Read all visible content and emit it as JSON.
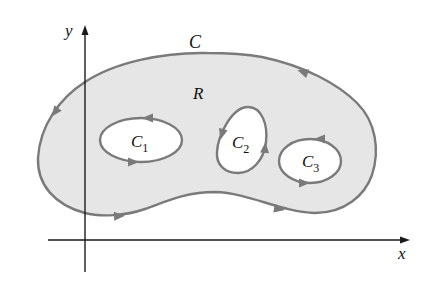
{
  "figure": {
    "type": "region-with-holes-diagram",
    "axes": {
      "x_label": "x",
      "y_label": "y"
    },
    "outer_curve": {
      "label": "C",
      "orientation": "counterclockwise"
    },
    "region": {
      "label": "R"
    },
    "inner_curves": [
      {
        "label": "C",
        "subscript": "1",
        "orientation": "clockwise"
      },
      {
        "label": "C",
        "subscript": "2",
        "orientation": "clockwise"
      },
      {
        "label": "C",
        "subscript": "3",
        "orientation": "clockwise"
      }
    ]
  },
  "colors": {
    "background": "#ffffff",
    "region_fill": "#e6e6e6",
    "hole_fill": "#ffffff",
    "curve_stroke": "#7a7a7a",
    "arrow_fill": "#7a7a7a",
    "axis_stroke": "#1a1a1a",
    "text": "#111111"
  }
}
